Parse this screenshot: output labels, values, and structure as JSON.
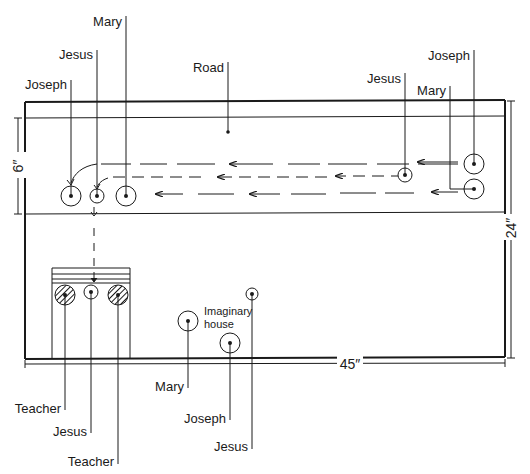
{
  "diagram": {
    "labels": {
      "road": "Road",
      "width": "45″",
      "height": "24″",
      "road_width": "6″",
      "imaginary_house_1": "Imaginary",
      "imaginary_house_2": "house"
    },
    "road_start": {
      "joseph": "Joseph",
      "jesus": "Jesus",
      "mary": "Mary"
    },
    "road_end": {
      "joseph": "Joseph",
      "jesus": "Jesus",
      "mary": "Mary"
    },
    "temple": {
      "teacher_left": "Teacher",
      "jesus": "Jesus",
      "teacher_right": "Teacher"
    },
    "house_area": {
      "mary": "Mary",
      "joseph": "Joseph",
      "jesus": "Jesus"
    }
  }
}
